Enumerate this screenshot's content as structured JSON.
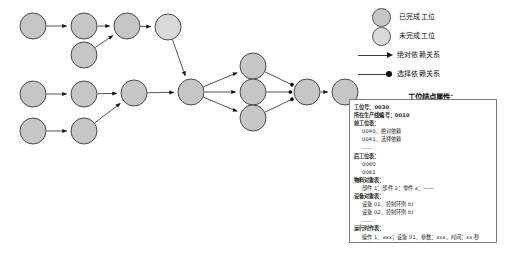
{
  "legend": {
    "items": [
      {
        "kind": "node",
        "style": "done",
        "label": "已完成工位"
      },
      {
        "kind": "node",
        "style": "todo",
        "label": "未完成工位"
      },
      {
        "kind": "edge",
        "style": "abs",
        "label": "绝对依赖关系"
      },
      {
        "kind": "edge",
        "style": "sel",
        "label": "选择依赖关系"
      }
    ]
  },
  "panel": {
    "title": "工位结点属性：",
    "lines": [
      {
        "text": "工位号：0030",
        "indent": false,
        "bold": true
      },
      {
        "text": "所在生产线编号：0010",
        "indent": false,
        "bold": true
      },
      {
        "text": "前工位表：",
        "indent": false,
        "bold": true
      },
      {
        "text": "0040、绝对依赖",
        "indent": true,
        "bold": false
      },
      {
        "text": "0041、选择依赖",
        "indent": true,
        "bold": false
      },
      {
        "text": "……",
        "indent": true,
        "bold": false
      },
      {
        "text": "后工位表：",
        "indent": false,
        "bold": true
      },
      {
        "text": "0060",
        "indent": true,
        "bold": false
      },
      {
        "text": "0061",
        "indent": true,
        "bold": false
      },
      {
        "text": "物料对象表：",
        "indent": false,
        "bold": true
      },
      {
        "text": "部件 1：部件 2：零件 a：——",
        "indent": true,
        "bold": false
      },
      {
        "text": "设备对象表：",
        "indent": false,
        "bold": true
      },
      {
        "text": "设备 01、控制环例 b)",
        "indent": true,
        "bold": false
      },
      {
        "text": "设备 02、控制环例 b)",
        "indent": true,
        "bold": false
      },
      {
        "text": "……",
        "indent": true,
        "bold": false
      },
      {
        "text": "运行时作表：",
        "indent": false,
        "bold": true
      },
      {
        "text": "操作 1、xxx；设备 01、参数：xxx、时间：xx 秒",
        "indent": true,
        "bold": false
      },
      {
        "text": "操作 2、xxx；设备 02、参数：xxx、时间：yy 秒",
        "indent": true,
        "bold": false
      }
    ]
  },
  "graph": {
    "colors": {
      "node_done": "#c6c6c6",
      "node_todo": "#d9d9d9",
      "node_stroke": "#4a4a4a",
      "edge": "#555555",
      "arrow": "#111111"
    },
    "nodes": [
      {
        "id": "n1",
        "cx": 33,
        "cy": 26,
        "r": 13,
        "state": "done"
      },
      {
        "id": "n2",
        "cx": 84,
        "cy": 26,
        "r": 13,
        "state": "done"
      },
      {
        "id": "n3",
        "cx": 127,
        "cy": 26,
        "r": 13,
        "state": "done"
      },
      {
        "id": "n4",
        "cx": 168,
        "cy": 27,
        "r": 13,
        "state": "todo"
      },
      {
        "id": "n5",
        "cx": 84,
        "cy": 55,
        "r": 13,
        "state": "done"
      },
      {
        "id": "n6",
        "cx": 33,
        "cy": 94,
        "r": 13,
        "state": "done"
      },
      {
        "id": "n7",
        "cx": 84,
        "cy": 94,
        "r": 13,
        "state": "done"
      },
      {
        "id": "n8",
        "cx": 134,
        "cy": 93,
        "r": 13,
        "state": "done"
      },
      {
        "id": "n9",
        "cx": 191,
        "cy": 92,
        "r": 13,
        "state": "done"
      },
      {
        "id": "n10",
        "cx": 33,
        "cy": 131,
        "r": 13,
        "state": "done"
      },
      {
        "id": "n11",
        "cx": 84,
        "cy": 131,
        "r": 13,
        "state": "done"
      },
      {
        "id": "n12",
        "cx": 253,
        "cy": 66,
        "r": 13,
        "state": "done"
      },
      {
        "id": "n13",
        "cx": 253,
        "cy": 92,
        "r": 13,
        "state": "done"
      },
      {
        "id": "n14",
        "cx": 253,
        "cy": 118,
        "r": 13,
        "state": "done"
      },
      {
        "id": "n15",
        "cx": 307,
        "cy": 92,
        "r": 13,
        "state": "done"
      },
      {
        "id": "n16",
        "cx": 345,
        "cy": 92,
        "r": 13,
        "state": "done"
      }
    ],
    "edges": [
      {
        "from": "n1",
        "to": "n2",
        "marker": "arrow"
      },
      {
        "from": "n2",
        "to": "n3",
        "marker": "arrow"
      },
      {
        "from": "n3",
        "to": "n4",
        "marker": "arrow"
      },
      {
        "from": "n5",
        "to": "n3",
        "marker": "arrow"
      },
      {
        "from": "n4",
        "to": "n9",
        "marker": "arrow"
      },
      {
        "from": "n6",
        "to": "n7",
        "marker": "arrow"
      },
      {
        "from": "n7",
        "to": "n8",
        "marker": "arrow"
      },
      {
        "from": "n8",
        "to": "n9",
        "marker": "arrow"
      },
      {
        "from": "n10",
        "to": "n11",
        "marker": "arrow"
      },
      {
        "from": "n11",
        "to": "n8",
        "marker": "arrow"
      },
      {
        "from": "n9",
        "to": "n12",
        "marker": "arrow"
      },
      {
        "from": "n9",
        "to": "n13",
        "marker": "arrow"
      },
      {
        "from": "n9",
        "to": "n14",
        "marker": "arrow"
      },
      {
        "from": "n12",
        "to": "n15",
        "marker": "dot"
      },
      {
        "from": "n13",
        "to": "n15",
        "marker": "dot"
      },
      {
        "from": "n14",
        "to": "n15",
        "marker": "dot"
      },
      {
        "from": "n15",
        "to": "n16",
        "marker": "arrow"
      }
    ]
  }
}
